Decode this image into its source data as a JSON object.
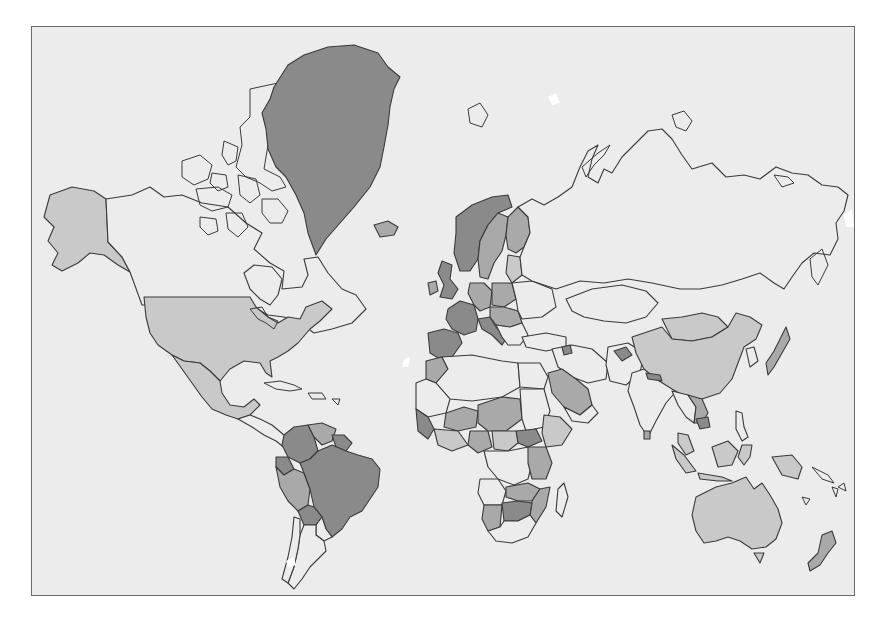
{
  "map": {
    "type": "choropleth",
    "projection": "mercator",
    "title": "",
    "legend": null,
    "colors": {
      "ocean": "#ececec",
      "frame_border": "#6a6a6a",
      "outline": "#3a3a3a",
      "level_0_nodata": "#ececec",
      "level_1_light": "#c9c9c9",
      "level_2_medium": "#a9a9a9",
      "level_3_dark": "#8a8a8a"
    },
    "shading": {
      "level_3_dark": [
        "Greenland",
        "Norway",
        "United Kingdom",
        "France",
        "Spain",
        "Portugal",
        "Italy",
        "Brazil",
        "Venezuela",
        "Colombia",
        "Bolivia",
        "Guyana",
        "Suriname",
        "Iceland",
        "South Sudan",
        "Botswana",
        "Zimbabwe",
        "Tajikistan",
        "Armenia",
        "Nepal",
        "Cambodia",
        "Guinea",
        "Senegal",
        "Sierra Leone"
      ],
      "level_2_medium": [
        "Sweden",
        "Finland",
        "Germany",
        "Poland",
        "Austria",
        "Hungary",
        "Romania",
        "Saudi Arabia",
        "Morocco",
        "Peru",
        "Ecuador",
        "Zambia",
        "Tanzania",
        "Namibia",
        "Ethiopia",
        "Nigeria",
        "Uganda",
        "Malawi",
        "Mozambique",
        "Niger",
        "Chad",
        "Sudan",
        "Ghana",
        "Mali",
        "Thailand",
        "Laos"
      ],
      "level_1_light": [
        "United States",
        "Alaska",
        "Mexico",
        "China",
        "Mongolia",
        "Australia",
        "New Zealand",
        "Indonesia",
        "Malaysia",
        "Papua New Guinea",
        "Philippines",
        "Baltic States",
        "Central African Republic",
        "Burkina Faso"
      ],
      "level_0_nodata": [
        "Canada",
        "Russia",
        "Kazakhstan",
        "India",
        "Iran",
        "Argentina",
        "Chile",
        "Egypt",
        "Libya",
        "Algeria",
        "DR Congo",
        "Angola",
        "South Africa",
        "Madagascar",
        "Japan",
        "Korea",
        "Turkey",
        "Iraq",
        "Afghanistan",
        "Pakistan",
        "Ukraine",
        "Belarus",
        "Paraguay",
        "Uruguay"
      ]
    }
  }
}
